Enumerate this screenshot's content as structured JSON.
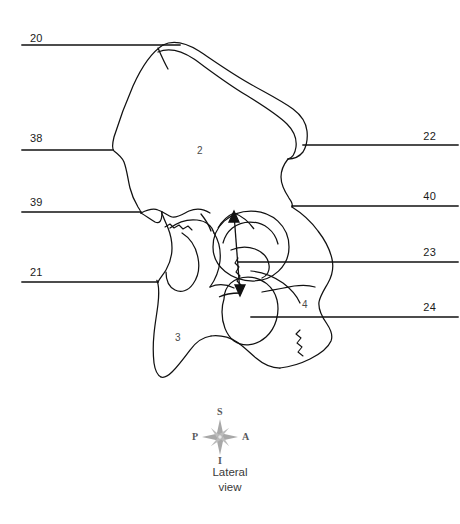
{
  "figure": {
    "kind": "anatomical-line-drawing",
    "view_caption_line1": "Lateral",
    "view_caption_line2": "view",
    "line_color": "#111111",
    "text_color": "#1a1a1a",
    "compass_color": "#9a9a9a",
    "background": "#ffffff"
  },
  "leaders": {
    "left": [
      {
        "id": "leader-20",
        "label": "20",
        "label_x": 30,
        "label_y": 32,
        "line_y": 45,
        "line_x1": 22,
        "line_x2": 180
      },
      {
        "id": "leader-38",
        "label": "38",
        "label_x": 30,
        "label_y": 132,
        "line_y": 150,
        "line_x1": 22,
        "line_x2": 113
      },
      {
        "id": "leader-39",
        "label": "39",
        "label_x": 30,
        "label_y": 196,
        "line_y": 212,
        "line_x1": 22,
        "line_x2": 141
      },
      {
        "id": "leader-21",
        "label": "21",
        "label_x": 30,
        "label_y": 266,
        "line_y": 282,
        "line_x1": 22,
        "line_x2": 158
      }
    ],
    "right": [
      {
        "id": "leader-22",
        "label": "22",
        "label_x": 430,
        "label_y": 130,
        "line_y": 145,
        "line_x1": 303,
        "line_x2": 458
      },
      {
        "id": "leader-40",
        "label": "40",
        "label_x": 430,
        "label_y": 190,
        "line_y": 206,
        "line_x1": 292,
        "line_x2": 458
      },
      {
        "id": "leader-23",
        "label": "23",
        "label_x": 430,
        "label_y": 246,
        "line_y": 262,
        "line_x1": 238,
        "line_x2": 458
      },
      {
        "id": "leader-24",
        "label": "24",
        "label_x": 430,
        "label_y": 301,
        "line_y": 317,
        "line_x1": 251,
        "line_x2": 458
      }
    ]
  },
  "inner_labels": [
    {
      "id": "inner-2",
      "label": "2",
      "x": 197,
      "y": 145
    },
    {
      "id": "inner-3",
      "label": "3",
      "x": 175,
      "y": 332
    },
    {
      "id": "inner-4",
      "label": "4",
      "x": 302,
      "y": 299
    }
  ],
  "compass": {
    "center_x": 220,
    "center_y": 437,
    "superior": "S",
    "inferior": "I",
    "posterior": "P",
    "anterior": "A",
    "superior_x": 217,
    "superior_y": 406,
    "inferior_x": 218,
    "inferior_y": 455,
    "posterior_x": 192,
    "posterior_y": 431,
    "anterior_x": 242,
    "anterior_y": 431
  },
  "caption": {
    "line1": "Lateral",
    "line1_y": 466,
    "line2": "view",
    "line2_y": 481
  }
}
